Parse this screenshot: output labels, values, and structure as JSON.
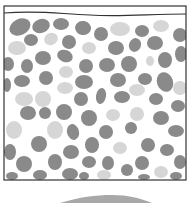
{
  "diagram": {
    "type": "pebble-container-cross-section",
    "colors": {
      "background": "#ffffff",
      "frame": "#333333",
      "pebble_dark": "#8a8a8a",
      "pebble_light": "#d6d6d6",
      "mound": "#a8a8a8"
    },
    "frame": {
      "x": 4,
      "y": 6,
      "width": 182,
      "height": 174
    },
    "surface_line": "M4,13 C40,10 60,14 90,15 C120,17 150,14 186,14",
    "pebbles": [
      {
        "cx": 20,
        "cy": 27,
        "rx": 11,
        "ry": 8,
        "rot": -25,
        "tone": "dark"
      },
      {
        "cx": 41,
        "cy": 26,
        "rx": 9,
        "ry": 7,
        "rot": -20,
        "tone": "dark"
      },
      {
        "cx": 61,
        "cy": 24,
        "rx": 8,
        "ry": 6,
        "rot": 0,
        "tone": "dark"
      },
      {
        "cx": 83,
        "cy": 28,
        "rx": 8,
        "ry": 7,
        "rot": 10,
        "tone": "dark"
      },
      {
        "cx": 101,
        "cy": 34,
        "rx": 7,
        "ry": 7,
        "rot": 0,
        "tone": "dark"
      },
      {
        "cx": 120,
        "cy": 29,
        "rx": 10,
        "ry": 7,
        "rot": 0,
        "tone": "light"
      },
      {
        "cx": 142,
        "cy": 31,
        "rx": 7,
        "ry": 6,
        "rot": 0,
        "tone": "dark"
      },
      {
        "cx": 161,
        "cy": 26,
        "rx": 8,
        "ry": 6,
        "rot": 0,
        "tone": "light"
      },
      {
        "cx": 180,
        "cy": 35,
        "rx": 7,
        "ry": 7,
        "rot": 0,
        "tone": "dark"
      },
      {
        "cx": 31,
        "cy": 40,
        "rx": 7,
        "ry": 6,
        "rot": 0,
        "tone": "dark"
      },
      {
        "cx": 51,
        "cy": 39,
        "rx": 7,
        "ry": 6,
        "rot": -20,
        "tone": "light"
      },
      {
        "cx": 69,
        "cy": 42,
        "rx": 7,
        "ry": 7,
        "rot": 0,
        "tone": "dark"
      },
      {
        "cx": 17,
        "cy": 48,
        "rx": 9,
        "ry": 7,
        "rot": 0,
        "tone": "light"
      },
      {
        "cx": 89,
        "cy": 48,
        "rx": 7,
        "ry": 6,
        "rot": 0,
        "tone": "light"
      },
      {
        "cx": 116,
        "cy": 48,
        "rx": 8,
        "ry": 7,
        "rot": 0,
        "tone": "dark"
      },
      {
        "cx": 135,
        "cy": 45,
        "rx": 6,
        "ry": 7,
        "rot": 20,
        "tone": "dark"
      },
      {
        "cx": 155,
        "cy": 43,
        "rx": 8,
        "ry": 7,
        "rot": 0,
        "tone": "dark"
      },
      {
        "cx": 181,
        "cy": 54,
        "rx": 6,
        "ry": 8,
        "rot": 0,
        "tone": "dark"
      },
      {
        "cx": 43,
        "cy": 58,
        "rx": 8,
        "ry": 7,
        "rot": 0,
        "tone": "dark"
      },
      {
        "cx": 65,
        "cy": 56,
        "rx": 8,
        "ry": 6,
        "rot": 20,
        "tone": "dark"
      },
      {
        "cx": 8,
        "cy": 64,
        "rx": 6,
        "ry": 7,
        "rot": 0,
        "tone": "dark"
      },
      {
        "cx": 27,
        "cy": 66,
        "rx": 6,
        "ry": 7,
        "rot": 0,
        "tone": "dark"
      },
      {
        "cx": 86,
        "cy": 66,
        "rx": 7,
        "ry": 7,
        "rot": 0,
        "tone": "dark"
      },
      {
        "cx": 107,
        "cy": 65,
        "rx": 8,
        "ry": 7,
        "rot": 0,
        "tone": "dark"
      },
      {
        "cx": 129,
        "cy": 64,
        "rx": 8,
        "ry": 8,
        "rot": 0,
        "tone": "dark"
      },
      {
        "cx": 150,
        "cy": 61,
        "rx": 4,
        "ry": 5,
        "rot": 0,
        "tone": "light"
      },
      {
        "cx": 165,
        "cy": 60,
        "rx": 7,
        "ry": 8,
        "rot": 0,
        "tone": "dark"
      },
      {
        "cx": 66,
        "cy": 72,
        "rx": 7,
        "ry": 6,
        "rot": 0,
        "tone": "light"
      },
      {
        "cx": 46,
        "cy": 78,
        "rx": 7,
        "ry": 7,
        "rot": 0,
        "tone": "dark"
      },
      {
        "cx": 22,
        "cy": 81,
        "rx": 8,
        "ry": 6,
        "rot": 0,
        "tone": "dark"
      },
      {
        "cx": 84,
        "cy": 82,
        "rx": 9,
        "ry": 7,
        "rot": 0,
        "tone": "dark"
      },
      {
        "cx": 118,
        "cy": 80,
        "rx": 8,
        "ry": 7,
        "rot": 0,
        "tone": "dark"
      },
      {
        "cx": 145,
        "cy": 79,
        "rx": 7,
        "ry": 6,
        "rot": 0,
        "tone": "dark"
      },
      {
        "cx": 165,
        "cy": 82,
        "rx": 8,
        "ry": 10,
        "rot": -20,
        "tone": "dark"
      },
      {
        "cx": 7,
        "cy": 85,
        "rx": 4,
        "ry": 7,
        "rot": 0,
        "tone": "dark"
      },
      {
        "cx": 65,
        "cy": 88,
        "rx": 8,
        "ry": 6,
        "rot": 0,
        "tone": "light"
      },
      {
        "cx": 137,
        "cy": 90,
        "rx": 8,
        "ry": 6,
        "rot": 0,
        "tone": "light"
      },
      {
        "cx": 180,
        "cy": 88,
        "rx": 7,
        "ry": 7,
        "rot": 0,
        "tone": "light"
      },
      {
        "cx": 24,
        "cy": 99,
        "rx": 9,
        "ry": 7,
        "rot": 0,
        "tone": "light"
      },
      {
        "cx": 43,
        "cy": 99,
        "rx": 8,
        "ry": 8,
        "rot": 0,
        "tone": "light"
      },
      {
        "cx": 81,
        "cy": 99,
        "rx": 7,
        "ry": 7,
        "rot": 0,
        "tone": "dark"
      },
      {
        "cx": 101,
        "cy": 96,
        "rx": 5,
        "ry": 8,
        "rot": 10,
        "tone": "dark"
      },
      {
        "cx": 122,
        "cy": 97,
        "rx": 8,
        "ry": 6,
        "rot": 0,
        "tone": "dark"
      },
      {
        "cx": 156,
        "cy": 99,
        "rx": 7,
        "ry": 6,
        "rot": 0,
        "tone": "dark"
      },
      {
        "cx": 178,
        "cy": 106,
        "rx": 7,
        "ry": 6,
        "rot": 0,
        "tone": "dark"
      },
      {
        "cx": 28,
        "cy": 113,
        "rx": 8,
        "ry": 7,
        "rot": 0,
        "tone": "dark"
      },
      {
        "cx": 45,
        "cy": 113,
        "rx": 6,
        "ry": 6,
        "rot": 0,
        "tone": "dark"
      },
      {
        "cx": 64,
        "cy": 112,
        "rx": 8,
        "ry": 8,
        "rot": 0,
        "tone": "dark"
      },
      {
        "cx": 89,
        "cy": 118,
        "rx": 8,
        "ry": 8,
        "rot": 0,
        "tone": "dark"
      },
      {
        "cx": 113,
        "cy": 115,
        "rx": 7,
        "ry": 6,
        "rot": 0,
        "tone": "light"
      },
      {
        "cx": 137,
        "cy": 114,
        "rx": 7,
        "ry": 7,
        "rot": 0,
        "tone": "light"
      },
      {
        "cx": 161,
        "cy": 118,
        "rx": 8,
        "ry": 7,
        "rot": 0,
        "tone": "dark"
      },
      {
        "cx": 14,
        "cy": 130,
        "rx": 8,
        "ry": 9,
        "rot": 0,
        "tone": "light"
      },
      {
        "cx": 55,
        "cy": 130,
        "rx": 8,
        "ry": 9,
        "rot": 0,
        "tone": "light"
      },
      {
        "cx": 73,
        "cy": 132,
        "rx": 6,
        "ry": 8,
        "rot": -15,
        "tone": "dark"
      },
      {
        "cx": 106,
        "cy": 132,
        "rx": 7,
        "ry": 7,
        "rot": 0,
        "tone": "dark"
      },
      {
        "cx": 131,
        "cy": 128,
        "rx": 6,
        "ry": 6,
        "rot": 0,
        "tone": "dark"
      },
      {
        "cx": 176,
        "cy": 131,
        "rx": 8,
        "ry": 6,
        "rot": 0,
        "tone": "dark"
      },
      {
        "cx": 39,
        "cy": 144,
        "rx": 8,
        "ry": 8,
        "rot": 0,
        "tone": "dark"
      },
      {
        "cx": 92,
        "cy": 145,
        "rx": 7,
        "ry": 8,
        "rot": 0,
        "tone": "dark"
      },
      {
        "cx": 120,
        "cy": 148,
        "rx": 7,
        "ry": 6,
        "rot": 0,
        "tone": "light"
      },
      {
        "cx": 148,
        "cy": 145,
        "rx": 7,
        "ry": 7,
        "rot": 0,
        "tone": "dark"
      },
      {
        "cx": 167,
        "cy": 150,
        "rx": 7,
        "ry": 6,
        "rot": 0,
        "tone": "dark"
      },
      {
        "cx": 10,
        "cy": 152,
        "rx": 6,
        "ry": 8,
        "rot": 0,
        "tone": "dark"
      },
      {
        "cx": 71,
        "cy": 152,
        "rx": 8,
        "ry": 7,
        "rot": 0,
        "tone": "dark"
      },
      {
        "cx": 55,
        "cy": 162,
        "rx": 7,
        "ry": 8,
        "rot": 0,
        "tone": "dark"
      },
      {
        "cx": 24,
        "cy": 164,
        "rx": 8,
        "ry": 8,
        "rot": 0,
        "tone": "dark"
      },
      {
        "cx": 89,
        "cy": 162,
        "rx": 7,
        "ry": 6,
        "rot": 0,
        "tone": "dark"
      },
      {
        "cx": 108,
        "cy": 163,
        "rx": 6,
        "ry": 7,
        "rot": 0,
        "tone": "dark"
      },
      {
        "cx": 142,
        "cy": 163,
        "rx": 7,
        "ry": 7,
        "rot": 0,
        "tone": "dark"
      },
      {
        "cx": 180,
        "cy": 162,
        "rx": 6,
        "ry": 7,
        "rot": 0,
        "tone": "dark"
      },
      {
        "cx": 127,
        "cy": 170,
        "rx": 6,
        "ry": 6,
        "rot": 0,
        "tone": "dark"
      },
      {
        "cx": 161,
        "cy": 172,
        "rx": 7,
        "ry": 6,
        "rot": 0,
        "tone": "light"
      },
      {
        "cx": 104,
        "cy": 175,
        "rx": 7,
        "ry": 5,
        "rot": 0,
        "tone": "light"
      },
      {
        "cx": 40,
        "cy": 175,
        "rx": 7,
        "ry": 5,
        "rot": 0,
        "tone": "dark"
      },
      {
        "cx": 70,
        "cy": 174,
        "rx": 8,
        "ry": 6,
        "rot": 0,
        "tone": "dark"
      },
      {
        "cx": 84,
        "cy": 176,
        "rx": 5,
        "ry": 4,
        "rot": 0,
        "tone": "dark"
      },
      {
        "cx": 12,
        "cy": 176,
        "rx": 6,
        "ry": 4,
        "rot": 0,
        "tone": "dark"
      },
      {
        "cx": 144,
        "cy": 177,
        "rx": 6,
        "ry": 3,
        "rot": 0,
        "tone": "dark"
      },
      {
        "cx": 176,
        "cy": 176,
        "rx": 6,
        "ry": 4,
        "rot": 0,
        "tone": "dark"
      }
    ],
    "mound": "M60,203 C80,197 95,195 112,195 C128,195 140,198 152,203 Z"
  }
}
